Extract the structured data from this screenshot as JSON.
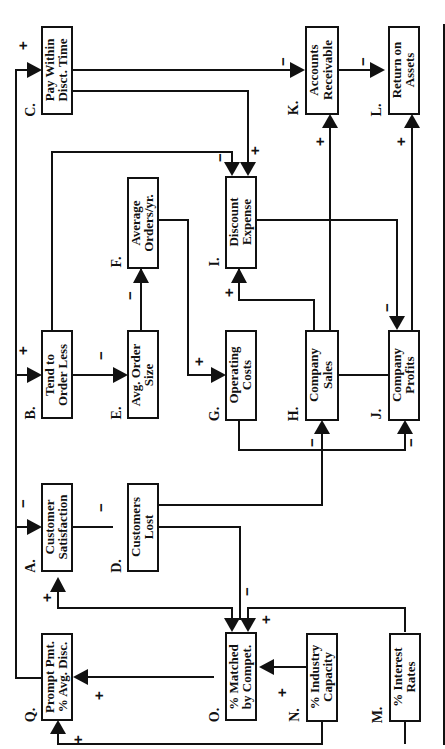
{
  "diagram": {
    "type": "causal-loop",
    "orientation": "rotated-90-ccw",
    "nodes": {
      "A": {
        "letter": "A.",
        "line1": "Customer",
        "line2": "Satisfaction"
      },
      "B": {
        "letter": "B.",
        "line1": "Tend to",
        "line2": "Order Less"
      },
      "C": {
        "letter": "C.",
        "line1": "Pay Within",
        "line2": "Disct. Time"
      },
      "D": {
        "letter": "D.",
        "line1": "Customers",
        "line2": "Lost"
      },
      "E": {
        "letter": "E.",
        "line1": "Avg. Order",
        "line2": "Size"
      },
      "F": {
        "letter": "F.",
        "line1": "Average",
        "line2": "Orders/yr."
      },
      "G": {
        "letter": "G.",
        "line1": "Operating",
        "line2": "Costs"
      },
      "H": {
        "letter": "H.",
        "line1": "Company",
        "line2": "Sales"
      },
      "I": {
        "letter": "I.",
        "line1": "Discount",
        "line2": "Expense"
      },
      "J": {
        "letter": "J.",
        "line1": "Company",
        "line2": "Profits"
      },
      "K": {
        "letter": "K.",
        "line1": "Accounts",
        "line2": "Receivable"
      },
      "L": {
        "letter": "L.",
        "line1": "Return on",
        "line2": "Assets"
      },
      "M": {
        "letter": "M.",
        "line1": "% Interest",
        "line2": "Rates"
      },
      "N": {
        "letter": "N.",
        "line1": "% Industry",
        "line2": "Capacity"
      },
      "O": {
        "letter": "O.",
        "line1": "% Matched",
        "line2": "by Compet."
      },
      "Q": {
        "letter": "Q.",
        "line1": "Prompt Pmt.",
        "line2": "% Avg. Disc."
      }
    },
    "links": [
      {
        "from": "Q",
        "to": "A",
        "sign": "−"
      },
      {
        "from": "Q",
        "to": "B",
        "sign": "+"
      },
      {
        "from": "Q",
        "to": "C",
        "sign": "+"
      },
      {
        "from": "A",
        "to": "D",
        "sign": "−"
      },
      {
        "from": "B",
        "to": "E",
        "sign": "−"
      },
      {
        "from": "E",
        "to": "F",
        "sign": "−"
      },
      {
        "from": "F",
        "to": "G",
        "sign": "+"
      },
      {
        "from": "B",
        "to": "I",
        "sign": "−"
      },
      {
        "from": "C",
        "to": "I",
        "sign": "+"
      },
      {
        "from": "C",
        "to": "K",
        "sign": "−"
      },
      {
        "from": "D",
        "to": "H",
        "sign": "−"
      },
      {
        "from": "D",
        "to": "O",
        "sign": "−"
      },
      {
        "from": "G",
        "to": "J",
        "sign": "−"
      },
      {
        "from": "H",
        "to": "I",
        "sign": "+"
      },
      {
        "from": "H",
        "to": "K",
        "sign": "+"
      },
      {
        "from": "I",
        "to": "J",
        "sign": "−"
      },
      {
        "from": "J",
        "to": "L",
        "sign": "+"
      },
      {
        "from": "K",
        "to": "L",
        "sign": "−"
      },
      {
        "from": "O",
        "to": "A",
        "sign": "+"
      },
      {
        "from": "O",
        "to": "Q",
        "sign": "+"
      },
      {
        "from": "N",
        "to": "O",
        "sign": "+"
      },
      {
        "from": "M",
        "to": "O",
        "sign": "+"
      },
      {
        "from": "M",
        "to": "Q",
        "sign": "+"
      },
      {
        "from": "N",
        "to": "Q",
        "sign": "+"
      }
    ],
    "signs": {
      "plus": "+",
      "minus": "−"
    }
  }
}
